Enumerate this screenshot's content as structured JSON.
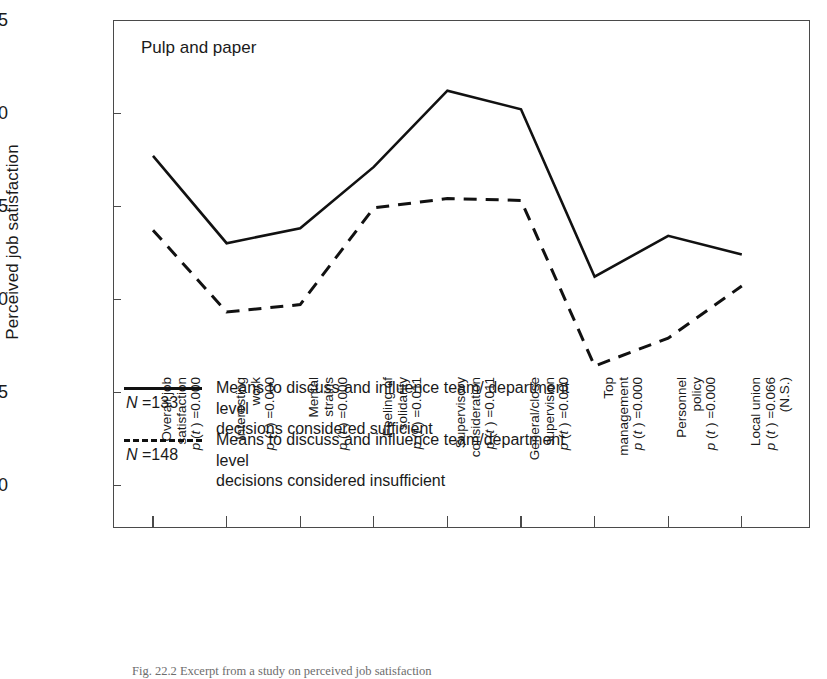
{
  "panel": {
    "title": "Pulp and paper"
  },
  "axes": {
    "y_title": "Perceived job satisfaction",
    "y_ticks": [
      "4.5",
      "4.0",
      "3.5",
      "3.0",
      "2.5",
      "2.0"
    ],
    "y_min": 2.0,
    "y_max": 4.5
  },
  "legend": {
    "series1": {
      "n_label": "N =133",
      "n_symbol": "N",
      "n_value": " =133",
      "text": "Means to discuss and influence team/ department level\ndecisions considered sufficient",
      "style": "solid"
    },
    "series2": {
      "n_label": "N =148",
      "n_symbol": "N",
      "n_value": " =148",
      "text": "Means to discuss and influence team/department level\ndecisions considered insufficient",
      "style": "dashed"
    }
  },
  "caption": "Fig. 22.2  Excerpt from a study on perceived job satisfaction",
  "chart_data": {
    "type": "line",
    "title": "Pulp and paper",
    "xlabel": "",
    "ylabel": "Perceived job satisfaction",
    "ylim": [
      2.0,
      4.5
    ],
    "ytick_step": 0.5,
    "grid": false,
    "legend_position": "inside-lower-left",
    "categories": [
      "Overall job satisfaction",
      "Interesting work",
      "Mental strains",
      "Feeling of solidarity",
      "Supervisory consideration",
      "General/close supervision",
      "Top management",
      "Personnel policy",
      "Local union"
    ],
    "category_lines": [
      [
        "Overall job",
        "satisfaction",
        "p (t ) =0.000"
      ],
      [
        "Interesting",
        "work",
        "p (t ) =0.000"
      ],
      [
        "Mental",
        "strains",
        "p (t ) =0.000"
      ],
      [
        "Feeling of",
        "solidarity",
        "p (t ) =0.011"
      ],
      [
        "Supervisory",
        "consideration",
        "p (t ) =0.011"
      ],
      [
        "General/close",
        "supervision",
        "p (t ) =0.000"
      ],
      [
        "Top",
        "management",
        "p (t ) =0.000"
      ],
      [
        "Personnel",
        "policy",
        "p (t ) =0.000"
      ],
      [
        "Local union",
        "p (t ) =0.066",
        "(N.S.)"
      ]
    ],
    "p_values": [
      "0.000",
      "0.000",
      "0.000",
      "0.011",
      "0.011",
      "0.000",
      "0.000",
      "0.000",
      "0.066"
    ],
    "significance_notes": [
      "",
      "",
      "",
      "",
      "",
      "",
      "",
      "",
      "(N.S.)"
    ],
    "series": [
      {
        "name": "Means to discuss and influence team/ department level decisions considered sufficient",
        "n": 133,
        "style": "solid",
        "values": [
          3.77,
          3.3,
          3.38,
          3.71,
          4.12,
          4.02,
          3.12,
          3.34,
          3.24
        ]
      },
      {
        "name": "Means to discuss and influence team/department level decisions considered insufficient",
        "n": 148,
        "style": "dashed",
        "values": [
          3.37,
          2.93,
          2.97,
          3.49,
          3.54,
          3.53,
          2.64,
          2.79,
          3.07
        ]
      }
    ]
  }
}
